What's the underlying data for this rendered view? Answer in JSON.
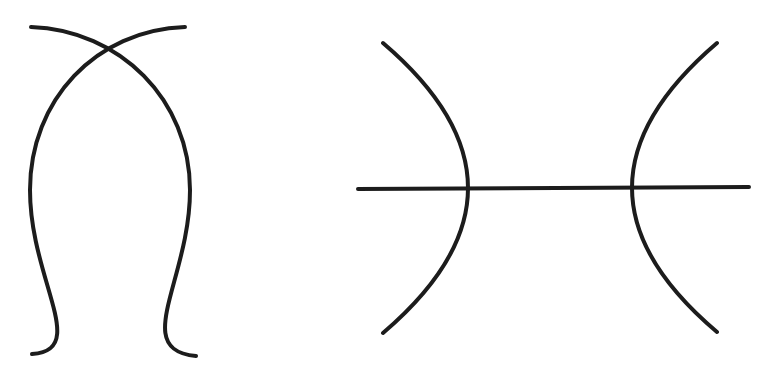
{
  "diagram": {
    "background": "#ffffff",
    "stroke_color": "#1c1c1c",
    "stroke_width": 4,
    "figures": [
      {
        "name": "intersecting-arcs-lens",
        "shapes": [
          {
            "type": "arc",
            "d": "M31,27 Q268,130 190,190 Q120,300 196,356"
          },
          {
            "type": "arc",
            "d": "M185,27 C60,40 30,120 30,190 C30,280 70,350 32,354"
          }
        ]
      },
      {
        "name": "arcs-with-horizontal-line",
        "shapes": [
          {
            "type": "arc",
            "d": "M383,43 Q553,188 383,333"
          },
          {
            "type": "arc",
            "d": "M717,43 Q547,188 717,332"
          },
          {
            "type": "line",
            "x1": 358,
            "y1": 189,
            "x2": 749,
            "y2": 187
          }
        ]
      }
    ]
  }
}
